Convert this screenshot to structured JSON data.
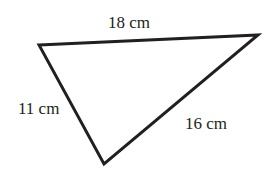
{
  "diagram": {
    "type": "triangle",
    "stroke_color": "#231f20",
    "vertices": [
      [
        39,
        45
      ],
      [
        258,
        35
      ],
      [
        104,
        164
      ]
    ],
    "sides": {
      "top": {
        "label": "18 cm"
      },
      "left": {
        "label": "11 cm"
      },
      "right": {
        "label": "16 cm"
      }
    }
  }
}
